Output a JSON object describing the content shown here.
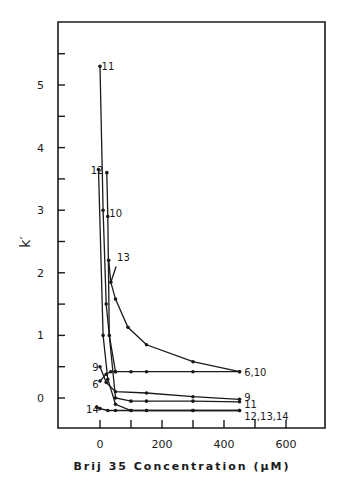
{
  "chart_data": {
    "type": "line",
    "title": "",
    "xlabel": "Brij 35  Concentration  (μM)",
    "ylabel": "k′",
    "xlim": [
      -120,
      720
    ],
    "ylim": [
      -0.45,
      5.95
    ],
    "xticks": [
      0,
      200,
      400,
      600
    ],
    "xticks_minor": [
      100,
      300,
      500
    ],
    "yticks": [
      0,
      1,
      2,
      3,
      4,
      5
    ],
    "yticks_minor": [
      0.5,
      1.5,
      2.5,
      3.5,
      4.5,
      5.5
    ],
    "grid": false,
    "series": [
      {
        "name": "11",
        "x": [
          0,
          10,
          20,
          50,
          100,
          150,
          300,
          450
        ],
        "y": [
          5.3,
          3.0,
          1.5,
          0.0,
          -0.05,
          -0.05,
          -0.05,
          -0.06
        ]
      },
      {
        "name": "12",
        "x": [
          -5,
          10,
          25,
          50,
          100,
          150,
          300,
          450
        ],
        "y": [
          3.65,
          1.0,
          0.3,
          -0.1,
          -0.2,
          -0.2,
          -0.2,
          -0.2
        ]
      },
      {
        "name": "10",
        "x": [
          22,
          25,
          30,
          50,
          100,
          150,
          300,
          450
        ],
        "y": [
          3.6,
          2.9,
          1.0,
          0.42,
          0.42,
          0.42,
          0.42,
          0.42
        ]
      },
      {
        "name": "13",
        "x": [
          28,
          35,
          50,
          90,
          150,
          300,
          450
        ],
        "y": [
          2.2,
          1.85,
          1.58,
          1.13,
          0.85,
          0.58,
          0.42
        ]
      },
      {
        "name": "9",
        "x": [
          0,
          20,
          50,
          150,
          300,
          450
        ],
        "y": [
          0.5,
          0.25,
          0.1,
          0.08,
          0.02,
          -0.02
        ]
      },
      {
        "name": "6",
        "x": [
          0,
          20,
          35,
          50
        ],
        "y": [
          0.27,
          0.38,
          0.42,
          0.42
        ]
      },
      {
        "name": "14",
        "x": [
          -10,
          0,
          25,
          50,
          100,
          150,
          300,
          450
        ],
        "y": [
          -0.15,
          -0.17,
          -0.2,
          -0.2,
          -0.2,
          -0.2,
          -0.2,
          -0.2
        ]
      }
    ],
    "annotations": [
      {
        "text": "11",
        "x": 5,
        "y": 5.3
      },
      {
        "text": "12",
        "x": -30,
        "y": 3.65
      },
      {
        "text": "10",
        "x": 30,
        "y": 2.95
      },
      {
        "text": "13",
        "x": 55,
        "y": 2.25
      },
      {
        "text": "9",
        "x": -25,
        "y": 0.5
      },
      {
        "text": "6",
        "x": -25,
        "y": 0.23
      },
      {
        "text": "14",
        "x": -45,
        "y": -0.17
      },
      {
        "text": "6,10",
        "x": 465,
        "y": 0.42
      },
      {
        "text": "9",
        "x": 465,
        "y": 0.02
      },
      {
        "text": "11",
        "x": 465,
        "y": -0.1
      },
      {
        "text": "12,13,14",
        "x": 465,
        "y": -0.28
      }
    ]
  }
}
